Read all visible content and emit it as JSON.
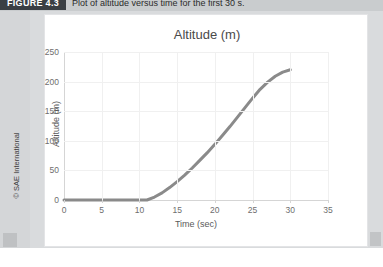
{
  "caption": {
    "figure_badge": "FIGURE 4.3",
    "text": "Plot of altitude versus time for the first 30 s."
  },
  "copyright": "© SAE International",
  "chart_data": {
    "type": "line",
    "title": "Altitude (m)",
    "xlabel": "Time (sec)",
    "ylabel": "Altitude (m)",
    "xlim": [
      0,
      35
    ],
    "ylim": [
      0,
      250
    ],
    "xticks": [
      0,
      5,
      10,
      15,
      20,
      25,
      30,
      35
    ],
    "yticks": [
      0,
      50,
      100,
      150,
      200,
      250
    ],
    "grid": true,
    "legend": "none",
    "line_color": "#8a8a8a",
    "series": [
      {
        "name": "Altitude",
        "x": [
          0,
          1,
          2,
          3,
          4,
          5,
          6,
          7,
          8,
          9,
          10,
          11,
          12,
          13,
          14,
          15,
          16,
          17,
          18,
          19,
          20,
          21,
          22,
          23,
          24,
          25,
          26,
          27,
          28,
          29,
          30
        ],
        "values": [
          0,
          0,
          0,
          0,
          0,
          0,
          0,
          0,
          0,
          0,
          0,
          0,
          5,
          12,
          21,
          31,
          42,
          54,
          67,
          80,
          94,
          109,
          124,
          140,
          156,
          172,
          187,
          199,
          209,
          216,
          220
        ]
      }
    ]
  }
}
